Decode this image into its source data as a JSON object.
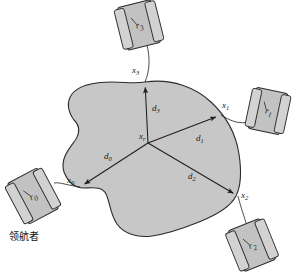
{
  "figure": {
    "colors": {
      "blob_fill": "#c7c7c7",
      "blob_stroke": "#2b2b2b",
      "robot_fill": "#c2c2c2",
      "robot_stroke": "#2b2b2b",
      "tread_fill": "#d2d2d2",
      "line": "#1f1f1f",
      "background": "#ffffff"
    }
  },
  "center": {
    "label": "x",
    "sub": "r",
    "x": 148,
    "y": 143
  },
  "vertices": [
    {
      "id": "x0",
      "label": "x",
      "sub": "0",
      "x": 80,
      "y": 187,
      "label_x": 67,
      "label_y": 176
    },
    {
      "id": "x1",
      "label": "x",
      "sub": "1",
      "x": 221,
      "y": 115,
      "label_x": 222,
      "label_y": 101
    },
    {
      "id": "x2",
      "label": "x",
      "sub": "2",
      "x": 238,
      "y": 196,
      "label_x": 241,
      "label_y": 191
    },
    {
      "id": "x3",
      "label": "x",
      "sub": "3",
      "x": 145,
      "y": 82,
      "label_x": 132,
      "label_y": 66
    }
  ],
  "distances": [
    {
      "id": "d0",
      "label": "d",
      "sub": "0",
      "label_x": 104,
      "label_y": 152
    },
    {
      "id": "d1",
      "label": "d",
      "sub": "1",
      "label_x": 196,
      "label_y": 134
    },
    {
      "id": "d2",
      "label": "d",
      "sub": "2",
      "label_x": 188,
      "label_y": 172
    },
    {
      "id": "d3",
      "label": "d",
      "sub": "3",
      "label_x": 152,
      "label_y": 104
    }
  ],
  "robots": [
    {
      "id": "r0",
      "label": "r",
      "sub": "0",
      "caption": "领航者",
      "cx": 33,
      "cy": 196,
      "rotation": -28,
      "w": 34,
      "h": 46,
      "caption_x": 9,
      "caption_y": 228
    },
    {
      "id": "r1",
      "label": "r",
      "sub": "1",
      "caption": "",
      "cx": 268,
      "cy": 111,
      "rotation": 12,
      "w": 32,
      "h": 42,
      "caption_x": 0,
      "caption_y": 0
    },
    {
      "id": "r2",
      "label": "r",
      "sub": "2",
      "caption": "",
      "cx": 252,
      "cy": 245,
      "rotation": -22,
      "w": 34,
      "h": 44,
      "caption_x": 0,
      "caption_y": 0
    },
    {
      "id": "r3",
      "label": "r",
      "sub": "3",
      "caption": "",
      "cx": 139,
      "cy": 25,
      "rotation": -14,
      "w": 34,
      "h": 44,
      "caption_x": 0,
      "caption_y": 0
    }
  ],
  "paths": {
    "blob": "M 145 82 C 172 78 196 88 211 102 C 226 116 236 134 239 154 C 242 174 240 188 236 196 C 230 208 214 216 199 222 C 184 228 166 234 152 236 C 138 238 124 234 117 224 C 110 214 110 202 106 194 C 102 186 92 188 84 188 C 75 188 68 182 64 172 C 60 160 68 150 74 142 C 80 134 80 126 74 120 C 68 112 66 102 72 94 C 80 84 98 82 112 82 C 126 82 134 84 145 82 Z",
    "link_r0": "M 80 187 C 66 185 60 182 54 183",
    "link_r1": "M 221 115 C 232 122 240 124 249 122",
    "link_r2": "M 238 196 C 241 208 244 216 247 226",
    "link_r3": "M 145 82 C 150 70 150 58 147 45"
  }
}
